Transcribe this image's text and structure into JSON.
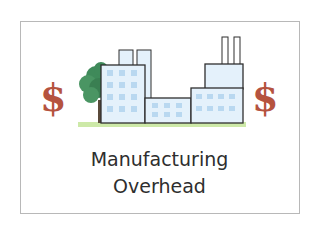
{
  "caption": {
    "line1": "Manufacturing",
    "line2": "Overhead"
  },
  "symbols": {
    "left_symbol": "$",
    "right_symbol": "$"
  },
  "colors": {
    "dollar": "#b5533f",
    "building_fill": "#e4f1fb",
    "window": "#b9d8f0",
    "outline": "#2f2f2f",
    "tree": "#3f8a5a",
    "ground": "#cde9a8",
    "frame": "#b8b8b8",
    "text": "#2e2e2e"
  },
  "illustration": {
    "subject": "factory-with-tree"
  }
}
